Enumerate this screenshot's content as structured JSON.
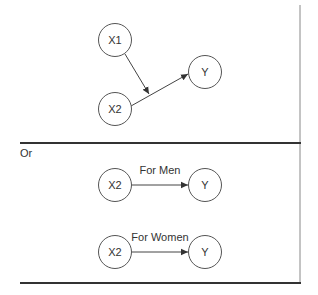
{
  "diagram": {
    "top_panel": {
      "nodes": [
        {
          "id": "x1",
          "label": "X1"
        },
        {
          "id": "x2",
          "label": "X2"
        },
        {
          "id": "y",
          "label": "Y"
        }
      ],
      "edges": [
        {
          "from": "x1",
          "to": "x2_y_edge",
          "description": "X1 moderates X2 → Y"
        },
        {
          "from": "x2",
          "to": "y"
        }
      ]
    },
    "separator_text": "Or",
    "bottom_panel": {
      "rows": [
        {
          "from_label": "X2",
          "to_label": "Y",
          "edge_label": "For Men"
        },
        {
          "from_label": "X2",
          "to_label": "Y",
          "edge_label": "For Women"
        }
      ]
    },
    "colors": {
      "line": "#444444",
      "rule": "#333333",
      "text": "#333333"
    }
  }
}
